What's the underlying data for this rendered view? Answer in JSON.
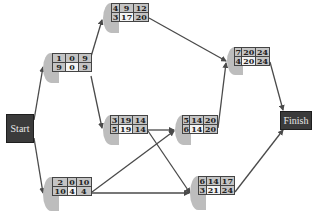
{
  "diagram": {
    "type": "network-diagram",
    "terminals": {
      "start": {
        "label": "Start"
      },
      "finish": {
        "label": "Finish"
      }
    },
    "nodes": [
      {
        "id": "1",
        "top": [
          "1",
          "0",
          "9"
        ],
        "bottom": [
          "9",
          "0",
          "9"
        ]
      },
      {
        "id": "2",
        "top": [
          "2",
          "0",
          "10"
        ],
        "bottom": [
          "10",
          "4",
          "4"
        ]
      },
      {
        "id": "3",
        "top": [
          "3",
          "19",
          "14"
        ],
        "bottom": [
          "5",
          "19",
          "14"
        ]
      },
      {
        "id": "4",
        "top": [
          "4",
          "9",
          "12"
        ],
        "bottom": [
          "3",
          "17",
          "20"
        ]
      },
      {
        "id": "5",
        "top": [
          "5",
          "14",
          "20"
        ],
        "bottom": [
          "6",
          "14",
          "20"
        ]
      },
      {
        "id": "6",
        "top": [
          "6",
          "14",
          "17"
        ],
        "bottom": [
          "3",
          "21",
          "24"
        ]
      },
      {
        "id": "7",
        "top": [
          "7",
          "20",
          "24"
        ],
        "bottom": [
          "4",
          "20",
          "24"
        ]
      }
    ],
    "edges": [
      {
        "from": "Start",
        "to": "1"
      },
      {
        "from": "Start",
        "to": "2"
      },
      {
        "from": "1",
        "to": "4"
      },
      {
        "from": "1",
        "to": "3"
      },
      {
        "from": "4",
        "to": "7"
      },
      {
        "from": "3",
        "to": "5"
      },
      {
        "from": "3",
        "to": "6"
      },
      {
        "from": "2",
        "to": "5"
      },
      {
        "from": "2",
        "to": "6"
      },
      {
        "from": "5",
        "to": "7"
      },
      {
        "from": "7",
        "to": "Finish"
      },
      {
        "from": "6",
        "to": "Finish"
      }
    ],
    "colors": {
      "terminal_fill": "#3b3b3b",
      "node_shade": "#c4c4c4",
      "node_light": "#f3f3f3",
      "edge": "#444444"
    }
  }
}
